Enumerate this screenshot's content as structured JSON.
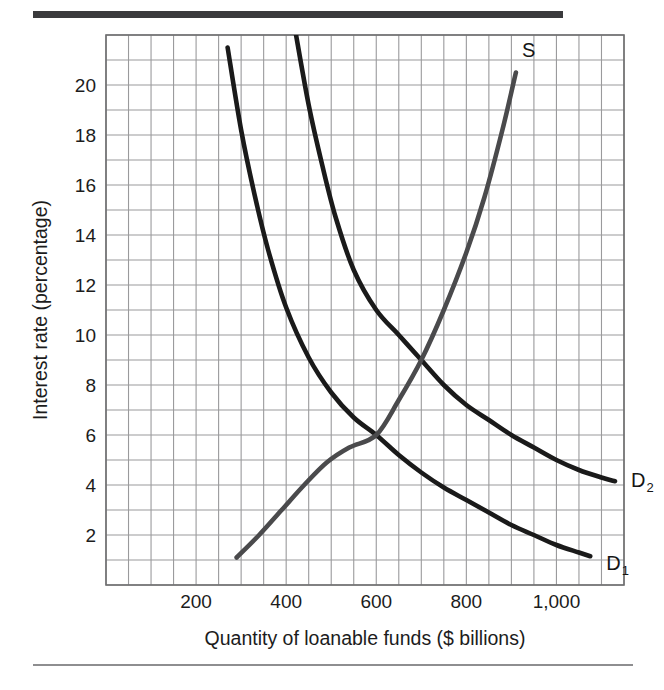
{
  "figure": {
    "top_rule_color": "#3a3a3c",
    "bottom_rule_color": "#8e8e90",
    "background": "#ffffff"
  },
  "chart_data": {
    "type": "line",
    "title": "",
    "xlabel": "Quantity of loanable funds ($ billions)",
    "ylabel": "Interest rate (percentage)",
    "xlim": [
      0,
      1150
    ],
    "ylim": [
      0,
      22
    ],
    "grid": true,
    "grid_color": "#9a9a9c",
    "grid_minor_step_x": 50,
    "grid_minor_step_y": 1,
    "xticks": [
      200,
      400,
      600,
      800,
      1000
    ],
    "xtick_labels": [
      "200",
      "400",
      "600",
      "800",
      "1,000"
    ],
    "yticks": [
      2,
      4,
      6,
      8,
      10,
      12,
      14,
      16,
      18,
      20
    ],
    "ytick_labels": [
      "2",
      "4",
      "6",
      "8",
      "10",
      "12",
      "14",
      "16",
      "18",
      "20"
    ],
    "legend_position": "inline-curve-labels",
    "series": [
      {
        "name": "D1",
        "label": "D",
        "label_subscript": "1",
        "color": "#1a1a1a",
        "kind": "demand",
        "points": [
          [
            270,
            21.5
          ],
          [
            300,
            18.2
          ],
          [
            330,
            15.6
          ],
          [
            360,
            13.4
          ],
          [
            400,
            11.1
          ],
          [
            450,
            9.1
          ],
          [
            500,
            7.7
          ],
          [
            550,
            6.7
          ],
          [
            600,
            6.0
          ],
          [
            650,
            5.2
          ],
          [
            700,
            4.5
          ],
          [
            750,
            3.9
          ],
          [
            800,
            3.4
          ],
          [
            850,
            2.9
          ],
          [
            900,
            2.4
          ],
          [
            950,
            2.0
          ],
          [
            1000,
            1.6
          ],
          [
            1050,
            1.3
          ],
          [
            1075,
            1.15
          ]
        ]
      },
      {
        "name": "D2",
        "label": "D",
        "label_subscript": "2",
        "color": "#1a1a1a",
        "kind": "demand",
        "points": [
          [
            420,
            22.2
          ],
          [
            450,
            19.2
          ],
          [
            480,
            16.8
          ],
          [
            510,
            14.7
          ],
          [
            550,
            12.6
          ],
          [
            600,
            11.0
          ],
          [
            650,
            10.0
          ],
          [
            700,
            9.0
          ],
          [
            750,
            8.0
          ],
          [
            800,
            7.2
          ],
          [
            850,
            6.6
          ],
          [
            900,
            6.0
          ],
          [
            950,
            5.5
          ],
          [
            1000,
            5.0
          ],
          [
            1050,
            4.6
          ],
          [
            1100,
            4.3
          ],
          [
            1130,
            4.15
          ]
        ]
      },
      {
        "name": "S",
        "label": "S",
        "label_subscript": "",
        "color": "#4a4a4c",
        "kind": "supply",
        "points": [
          [
            290,
            1.1
          ],
          [
            340,
            2.0
          ],
          [
            390,
            3.0
          ],
          [
            440,
            4.0
          ],
          [
            490,
            4.9
          ],
          [
            540,
            5.5
          ],
          [
            600,
            6.0
          ],
          [
            650,
            7.4
          ],
          [
            700,
            9.0
          ],
          [
            750,
            11.0
          ],
          [
            800,
            13.3
          ],
          [
            840,
            15.5
          ],
          [
            880,
            18.2
          ],
          [
            910,
            20.5
          ]
        ]
      }
    ],
    "annotations": [
      {
        "name": "equilibrium-initial",
        "x": 600,
        "y": 6,
        "text": ""
      },
      {
        "name": "equilibrium-new",
        "x": 700,
        "y": 9,
        "text": ""
      }
    ]
  }
}
